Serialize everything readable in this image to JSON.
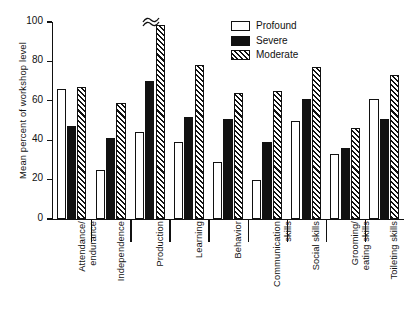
{
  "chart_data": {
    "type": "bar",
    "title": "",
    "xlabel": "",
    "ylabel": "Mean percent of workshop level",
    "ylim": [
      0,
      100
    ],
    "yticks": [
      0,
      20,
      40,
      60,
      80,
      100
    ],
    "grid": false,
    "legend_position": "top-right",
    "categories": [
      "Attendance/\nendurance",
      "Independence",
      "Production",
      "Learning",
      "Behavior",
      "Communication\nskills",
      "Social skills",
      "Grooming/\neating skills",
      "Toileting skills"
    ],
    "series": [
      {
        "name": "Profound",
        "fill": "open",
        "values": [
          66,
          25,
          44,
          39,
          29,
          20,
          50,
          33,
          61
        ]
      },
      {
        "name": "Severe",
        "fill": "solid",
        "values": [
          47,
          41,
          70,
          52,
          51,
          39,
          61,
          36,
          51
        ]
      },
      {
        "name": "Moderate",
        "fill": "hatched",
        "values": [
          67,
          59,
          100,
          78,
          64,
          65,
          77,
          46,
          73
        ]
      }
    ],
    "annotations": [
      {
        "type": "axis-break",
        "series": "Moderate",
        "category": "Production",
        "note": "bar exceeds axis maximum"
      }
    ],
    "colors": {
      "ink": "#111111",
      "background": "#ffffff"
    }
  },
  "categories_display": [
    {
      "lines": [
        "Attendance/",
        "endurance"
      ]
    },
    {
      "lines": [
        "Independence"
      ]
    },
    {
      "lines": [
        "Production"
      ]
    },
    {
      "lines": [
        "Learning"
      ]
    },
    {
      "lines": [
        "Behavior"
      ]
    },
    {
      "lines": [
        "Communication",
        "skills"
      ]
    },
    {
      "lines": [
        "Social skills"
      ]
    },
    {
      "lines": [
        "Grooming/",
        "eating skills"
      ]
    },
    {
      "lines": [
        "Toileting skills"
      ]
    }
  ],
  "axis": {
    "y_title": "Mean percent of workshop level",
    "y_tick_labels": [
      "0",
      "20",
      "40",
      "60",
      "80",
      "100"
    ]
  },
  "legend": {
    "items": [
      {
        "label": "Profound",
        "swatch": "open-square-icon"
      },
      {
        "label": "Severe",
        "swatch": "filled-square-icon"
      },
      {
        "label": "Moderate",
        "swatch": "hatched-square-icon"
      }
    ]
  }
}
